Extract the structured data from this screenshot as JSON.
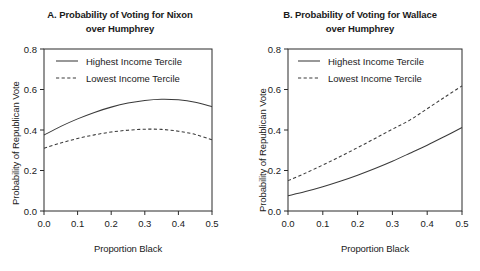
{
  "figure": {
    "background": "#ffffff",
    "line_color": "#3a3a3a",
    "axis_color": "#2b2b2b"
  },
  "panelA": {
    "title_line1": "A. Probability of Voting for Nixon",
    "title_line2": "over Humphrey",
    "ylabel": "Probability of Republican Vote",
    "xlabel": "Proportion Black",
    "legend": {
      "highest": "Highest Income Tercile",
      "lowest": "Lowest Income Tercile"
    },
    "xticks": [
      "0.0",
      "0.1",
      "0.2",
      "0.3",
      "0.4",
      "0.5"
    ],
    "yticks": [
      "0.0",
      "0.2",
      "0.4",
      "0.6",
      "0.8"
    ]
  },
  "panelB": {
    "title_line1": "B. Probability of Voting for Wallace",
    "title_line2": "over Humphrey",
    "ylabel": "Probability of Republican Vote",
    "xlabel": "Proportion Black",
    "legend": {
      "highest": "Highest Income Tercile",
      "lowest": "Lowest Income Tercile"
    },
    "xticks": [
      "0.0",
      "0.1",
      "0.2",
      "0.3",
      "0.4",
      "0.5"
    ],
    "yticks": [
      "0.0",
      "0.2",
      "0.4",
      "0.6",
      "0.8"
    ]
  },
  "chart_data": [
    {
      "type": "line",
      "panel": "A",
      "title": "A. Probability of Voting for Nixon over Humphrey",
      "xlabel": "Proportion Black",
      "ylabel": "Probability of Republican Vote",
      "xlim": [
        0.0,
        0.5
      ],
      "ylim": [
        0.0,
        0.8
      ],
      "xticks": [
        0.0,
        0.1,
        0.2,
        0.3,
        0.4,
        0.5
      ],
      "yticks": [
        0.0,
        0.2,
        0.4,
        0.6,
        0.8
      ],
      "grid": false,
      "legend_position": "top-left inside",
      "x": [
        0.0,
        0.05,
        0.1,
        0.15,
        0.2,
        0.25,
        0.3,
        0.35,
        0.4,
        0.45,
        0.5
      ],
      "series": [
        {
          "name": "Highest Income Tercile",
          "style": "solid",
          "values": [
            0.375,
            0.418,
            0.455,
            0.487,
            0.513,
            0.533,
            0.546,
            0.552,
            0.549,
            0.537,
            0.515
          ]
        },
        {
          "name": "Lowest Income Tercile",
          "style": "dashed",
          "values": [
            0.31,
            0.336,
            0.358,
            0.376,
            0.39,
            0.399,
            0.404,
            0.403,
            0.394,
            0.378,
            0.352
          ]
        }
      ]
    },
    {
      "type": "line",
      "panel": "B",
      "title": "B. Probability of Voting for Wallace over Humphrey",
      "xlabel": "Proportion Black",
      "ylabel": "Probability of Republican Vote",
      "xlim": [
        0.0,
        0.5
      ],
      "ylim": [
        0.0,
        0.8
      ],
      "xticks": [
        0.0,
        0.1,
        0.2,
        0.3,
        0.4,
        0.5
      ],
      "yticks": [
        0.0,
        0.2,
        0.4,
        0.6,
        0.8
      ],
      "grid": false,
      "legend_position": "top-left inside",
      "x": [
        0.0,
        0.05,
        0.1,
        0.15,
        0.2,
        0.25,
        0.3,
        0.35,
        0.4,
        0.45,
        0.5
      ],
      "series": [
        {
          "name": "Highest Income Tercile",
          "style": "solid",
          "values": [
            0.075,
            0.096,
            0.12,
            0.147,
            0.177,
            0.21,
            0.246,
            0.285,
            0.325,
            0.368,
            0.412
          ]
        },
        {
          "name": "Lowest Income Tercile",
          "style": "dashed",
          "values": [
            0.15,
            0.187,
            0.227,
            0.269,
            0.313,
            0.358,
            0.404,
            0.449,
            0.505,
            0.562,
            0.618
          ]
        }
      ]
    }
  ]
}
